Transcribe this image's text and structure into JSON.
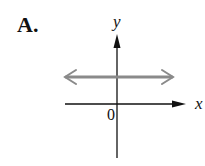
{
  "option_label": "A.",
  "graph": {
    "x_axis_label": "x",
    "y_axis_label": "y",
    "origin_label": "0",
    "line": {
      "description": "horizontal line above x-axis, arrows both ends",
      "color": "#8a8a8a"
    },
    "axis_color": "#111111"
  }
}
